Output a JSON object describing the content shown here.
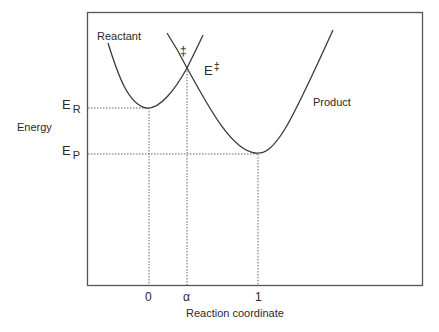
{
  "diagram": {
    "type": "potential-energy-curves",
    "y_axis_label": "Energy",
    "x_axis_label": "Reaction coordinate",
    "curves": [
      {
        "name": "Reactant",
        "label": "Reactant",
        "minimum_x": "0",
        "minimum_level": "E_R"
      },
      {
        "name": "Product",
        "label": "Product",
        "minimum_x": "1",
        "minimum_level": "E_P"
      }
    ],
    "energy_levels": {
      "reactant": {
        "main": "E",
        "sub": "R"
      },
      "product": {
        "main": "E",
        "sub": "P"
      },
      "transition": {
        "main": "E",
        "sup": "‡"
      }
    },
    "transition_marker": "‡",
    "x_ticks": [
      "0",
      "α",
      "1"
    ],
    "colors": {
      "line": "#3a3a3a",
      "frame": "#555555",
      "guide": "#555555"
    }
  }
}
